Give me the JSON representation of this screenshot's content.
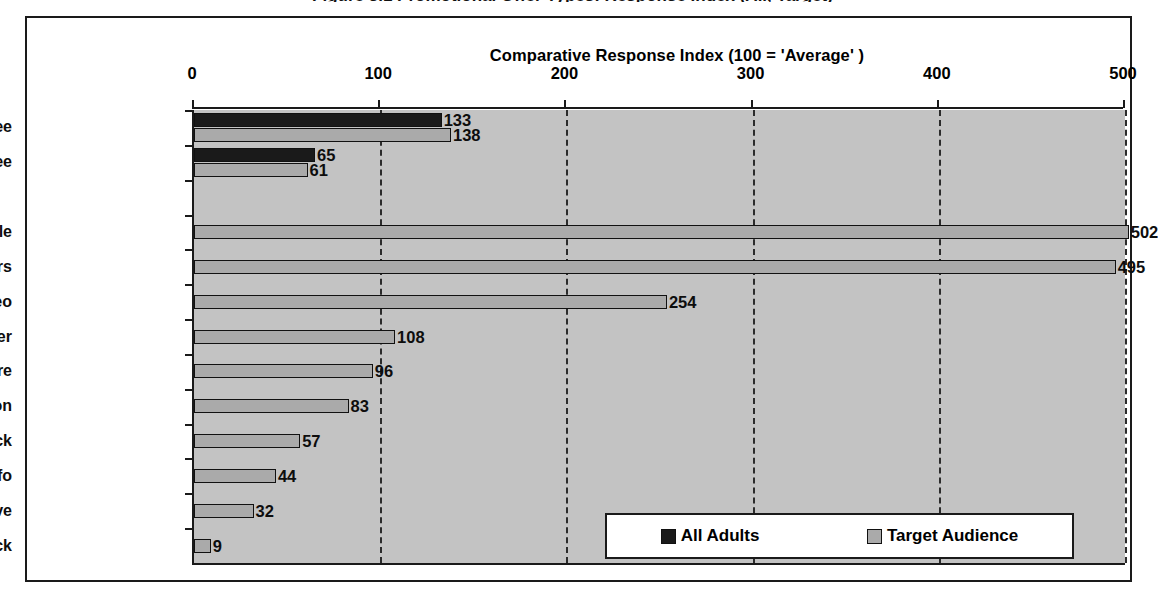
{
  "figure": {
    "title": "Figure 3.1  Promotional Offer Types: Response Index (All, Target)"
  },
  "chart_data": {
    "type": "bar",
    "orientation": "horizontal",
    "title": "",
    "xlabel": "Comparative Response Index (100 = 'Average' )",
    "ylabel": "",
    "xlim": [
      0,
      500
    ],
    "xticks": [
      0,
      100,
      200,
      300,
      400,
      500
    ],
    "xtick_labels": [
      "0",
      "100",
      "200",
      "300",
      "400",
      "500"
    ],
    "grid": true,
    "grid_axis": "x",
    "grid_style": "dashed",
    "legend_position": "bottom-right",
    "categories": [
      "Free",
      "No Free",
      "",
      "Sample",
      "Vouchers",
      "DVD/Video",
      "Movie Trailer",
      "Brochure",
      "Competition",
      "Info Pack",
      "More Info",
      "Test Drive",
      "Call-back"
    ],
    "series": [
      {
        "name": "All Adults",
        "color": "#1a1a1a",
        "values": [
          133,
          65,
          null,
          null,
          null,
          null,
          null,
          null,
          null,
          null,
          null,
          null,
          null
        ]
      },
      {
        "name": "Target Audience",
        "color": "#aaaaaa",
        "values": [
          138,
          61,
          null,
          502,
          495,
          254,
          108,
          96,
          83,
          57,
          44,
          32,
          9
        ]
      }
    ],
    "data_labels": [
      {
        "category": "Free",
        "series": "All Adults",
        "value": 133
      },
      {
        "category": "Free",
        "series": "Target Audience",
        "value": 138
      },
      {
        "category": "No Free",
        "series": "All Adults",
        "value": 65
      },
      {
        "category": "No Free",
        "series": "Target Audience",
        "value": 61
      },
      {
        "category": "Sample",
        "series": "Target Audience",
        "value": 502
      },
      {
        "category": "Vouchers",
        "series": "Target Audience",
        "value": 495
      },
      {
        "category": "DVD/Video",
        "series": "Target Audience",
        "value": 254
      },
      {
        "category": "Movie Trailer",
        "series": "Target Audience",
        "value": 108
      },
      {
        "category": "Brochure",
        "series": "Target Audience",
        "value": 96
      },
      {
        "category": "Competition",
        "series": "Target Audience",
        "value": 83
      },
      {
        "category": "Info Pack",
        "series": "Target Audience",
        "value": 57
      },
      {
        "category": "More Info",
        "series": "Target Audience",
        "value": 44
      },
      {
        "category": "Test Drive",
        "series": "Target Audience",
        "value": 32
      },
      {
        "category": "Call-back",
        "series": "Target Audience",
        "value": 9
      }
    ]
  },
  "legend": {
    "entries": [
      {
        "label": "All Adults",
        "swatch": "all"
      },
      {
        "label": "Target Audience",
        "swatch": "target"
      }
    ]
  },
  "colors": {
    "plot_background": "#c3c3c3",
    "frame": "#1a1a1a",
    "series_all_adults": "#1a1a1a",
    "series_target_audience": "#aaaaaa",
    "gridline": "#2b2b2b",
    "page_background": "#ffffff"
  }
}
